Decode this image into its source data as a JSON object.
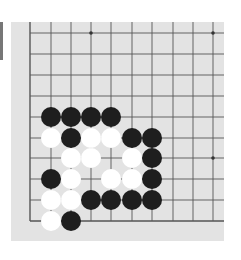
{
  "board": {
    "background": "#e3e3e3",
    "line_color": "#555555",
    "columns_x": [
      30,
      51,
      71,
      91,
      111,
      132,
      152,
      173,
      193,
      213
    ],
    "rows_y": [
      33,
      54,
      75,
      96,
      117,
      138,
      158,
      179,
      200,
      221
    ],
    "star_points": [
      [
        3,
        0
      ],
      [
        9,
        0
      ],
      [
        9,
        6
      ]
    ],
    "stone_colors": {
      "black": "#1e1e1e",
      "white": "#ffffff"
    },
    "stones": [
      {
        "c": 1,
        "r": 4,
        "color": "black"
      },
      {
        "c": 2,
        "r": 4,
        "color": "black"
      },
      {
        "c": 3,
        "r": 4,
        "color": "black"
      },
      {
        "c": 4,
        "r": 4,
        "color": "black"
      },
      {
        "c": 1,
        "r": 5,
        "color": "white"
      },
      {
        "c": 2,
        "r": 5,
        "color": "black"
      },
      {
        "c": 3,
        "r": 5,
        "color": "white"
      },
      {
        "c": 4,
        "r": 5,
        "color": "white"
      },
      {
        "c": 5,
        "r": 5,
        "color": "black"
      },
      {
        "c": 6,
        "r": 5,
        "color": "black"
      },
      {
        "c": 2,
        "r": 6,
        "color": "white"
      },
      {
        "c": 3,
        "r": 6,
        "color": "white"
      },
      {
        "c": 5,
        "r": 6,
        "color": "white"
      },
      {
        "c": 6,
        "r": 6,
        "color": "black"
      },
      {
        "c": 1,
        "r": 7,
        "color": "black"
      },
      {
        "c": 2,
        "r": 7,
        "color": "white"
      },
      {
        "c": 4,
        "r": 7,
        "color": "white"
      },
      {
        "c": 5,
        "r": 7,
        "color": "white"
      },
      {
        "c": 6,
        "r": 7,
        "color": "black"
      },
      {
        "c": 1,
        "r": 8,
        "color": "white"
      },
      {
        "c": 2,
        "r": 8,
        "color": "white"
      },
      {
        "c": 3,
        "r": 8,
        "color": "black"
      },
      {
        "c": 4,
        "r": 8,
        "color": "black"
      },
      {
        "c": 5,
        "r": 8,
        "color": "black"
      },
      {
        "c": 6,
        "r": 8,
        "color": "black"
      },
      {
        "c": 1,
        "r": 9,
        "color": "white"
      },
      {
        "c": 2,
        "r": 9,
        "color": "black"
      }
    ]
  }
}
